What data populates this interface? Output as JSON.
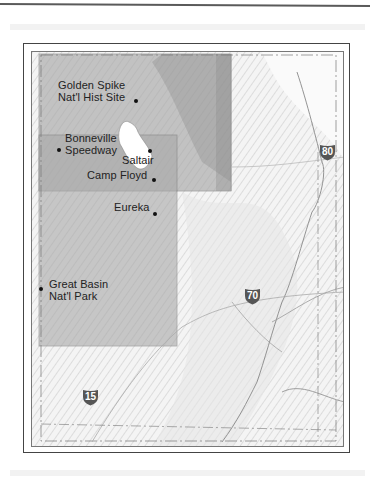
{
  "map": {
    "places": [
      {
        "name": "Golden Spike\nNat'l Hist Site",
        "line1": "Golden Spike",
        "line2": "Nat'l Hist Site"
      },
      {
        "name": "Bonneville Speedway",
        "line1": "Bonneville",
        "line2": "Speedway"
      },
      {
        "name": "Saltair",
        "line1": "Saltair"
      },
      {
        "name": "Camp Floyd",
        "line1": "Camp Floyd"
      },
      {
        "name": "Eureka",
        "line1": "Eureka"
      },
      {
        "name": "Great Basin Nat'l Park",
        "line1": "Great Basin",
        "line2": "Nat'l Park"
      }
    ],
    "highways": [
      {
        "number": "80",
        "type": "interstate"
      },
      {
        "number": "70",
        "type": "interstate"
      },
      {
        "number": "15",
        "type": "interstate"
      }
    ],
    "colors": {
      "shaded_region": "#a8a8a8",
      "lake": "#ffffff",
      "frame": "#444444",
      "shield": "#555555"
    }
  }
}
